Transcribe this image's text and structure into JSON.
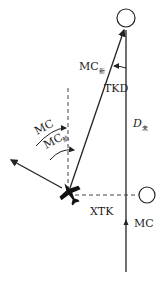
{
  "diagram": {
    "labels": {
      "mc_new": "MC",
      "mc_new_sub": "新",
      "tkd": "TKD",
      "mc_left": "MC",
      "mc_hang": "MC",
      "mc_hang_sub": "航",
      "d_remaining": "D",
      "d_remaining_sub": "未",
      "xtk": "XTK",
      "mc_track": "MC"
    },
    "colors": {
      "line": "#222222",
      "dashed": "#444444",
      "background": "#ffffff"
    }
  }
}
